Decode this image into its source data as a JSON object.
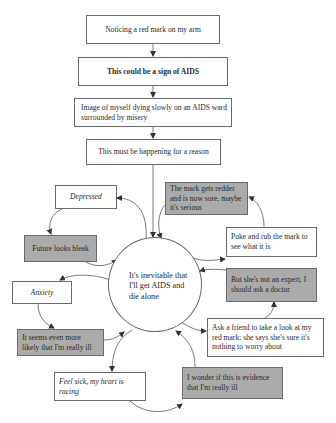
{
  "diagram": {
    "type": "flowchart-vicious-cycle",
    "flow": [
      {
        "id": "noticing",
        "text": "Noticing a red mark on my arm",
        "style": "plain"
      },
      {
        "id": "sign",
        "text": "This could be a sign of AIDS",
        "style": "bold"
      },
      {
        "id": "image",
        "text": "Image of myself dying slowly on an AIDS ward surrounded by misery",
        "style": "plain"
      },
      {
        "id": "reason",
        "text": "This must be happening for a reason",
        "style": "plain"
      }
    ],
    "center": {
      "id": "core",
      "text": "It's inevitable that I'll get AIDS and die alone",
      "shape": "circle"
    },
    "satellites": [
      {
        "id": "depressed",
        "text": "Depressed",
        "style": "italic",
        "fill": "white"
      },
      {
        "id": "bleak",
        "text": "Future looks bleak",
        "style": "plain",
        "fill": "gray"
      },
      {
        "id": "anxiety",
        "text": "Anxiety",
        "style": "italic",
        "fill": "white"
      },
      {
        "id": "likely",
        "text": "It seems even more likely that I'm really ill",
        "style": "plain",
        "fill": "gray"
      },
      {
        "id": "sick",
        "text": "Feel sick, my heart is racing",
        "style": "italic",
        "fill": "white"
      },
      {
        "id": "wonder",
        "text": "I wonder if this is evidence that I'm really ill",
        "style": "plain",
        "fill": "gray"
      },
      {
        "id": "friend",
        "text": "Ask a friend to take a look at my red mark; she says she's sure it's nothing to worry about",
        "style": "plain",
        "fill": "white"
      },
      {
        "id": "expert",
        "text": "But she's not an expert, I should ask a doctor",
        "style": "plain",
        "fill": "gray"
      },
      {
        "id": "poke",
        "text": "Poke and rub the mark to see what it is",
        "style": "plain",
        "fill": "white"
      },
      {
        "id": "redder",
        "text": "The mark gets redder and is now sore, maybe it's serious",
        "style": "plain",
        "fill": "gray"
      }
    ],
    "edges": [
      [
        "noticing",
        "sign"
      ],
      [
        "sign",
        "image"
      ],
      [
        "image",
        "reason"
      ],
      [
        "reason",
        "core"
      ],
      [
        "core",
        "depressed"
      ],
      [
        "depressed",
        "bleak"
      ],
      [
        "bleak",
        "core"
      ],
      [
        "core",
        "anxiety"
      ],
      [
        "anxiety",
        "likely"
      ],
      [
        "likely",
        "core"
      ],
      [
        "core",
        "sick"
      ],
      [
        "sick",
        "wonder"
      ],
      [
        "wonder",
        "core"
      ],
      [
        "core",
        "friend"
      ],
      [
        "friend",
        "expert"
      ],
      [
        "expert",
        "core"
      ],
      [
        "core",
        "poke"
      ],
      [
        "poke",
        "redder"
      ],
      [
        "redder",
        "core"
      ]
    ],
    "colors": {
      "gray_fill": "#ababab",
      "stroke": "#6a6a6a",
      "background": "#ffffff"
    }
  }
}
